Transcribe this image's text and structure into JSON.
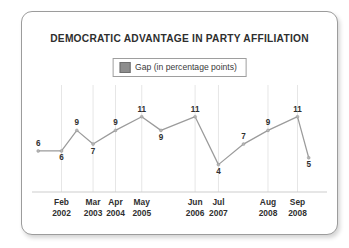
{
  "card": {
    "border_color": "#9c9c9c",
    "background": "#ffffff"
  },
  "title": "DEMOCRATIC ADVANTAGE IN PARTY AFFILIATION",
  "legend": {
    "swatch_color": "#8d8d8d",
    "label": "Gap (in percentage points)"
  },
  "chart_data": {
    "type": "line",
    "title": "DEMOCRATIC ADVANTAGE IN PARTY AFFILIATION",
    "xlabel": "",
    "ylabel": "",
    "ylim": [
      0,
      13
    ],
    "grid": "vertical",
    "legend_position": "top-center",
    "line_color": "#9b9b9b",
    "marker_color": "#b4b4b4",
    "series": [
      {
        "name": "Gap (in percentage points)",
        "values": [
          6,
          6,
          9,
          7,
          9,
          11,
          9,
          11,
          4,
          7,
          9,
          11,
          5
        ]
      }
    ],
    "point_labels": [
      "6",
      "6",
      "9",
      "7",
      "9",
      "11",
      "9",
      "11",
      "4",
      "7",
      "9",
      "11",
      "5"
    ],
    "label_side": [
      "above",
      "below",
      "above",
      "below",
      "above",
      "above",
      "below",
      "above",
      "below",
      "above",
      "above",
      "above",
      "below"
    ],
    "x_positions": [
      0.021,
      0.1,
      0.152,
      0.207,
      0.283,
      0.372,
      0.437,
      0.553,
      0.632,
      0.717,
      0.8,
      0.9,
      0.938
    ],
    "axis_labels": [
      {
        "month": "Feb",
        "year": "2002",
        "pos": 0.1
      },
      {
        "month": "Mar",
        "year": "2003",
        "pos": 0.207
      },
      {
        "month": "Apr",
        "year": "2004",
        "pos": 0.283
      },
      {
        "month": "May",
        "year": "2005",
        "pos": 0.372
      },
      {
        "month": "Jun",
        "year": "2006",
        "pos": 0.553
      },
      {
        "month": "Jul",
        "year": "2007",
        "pos": 0.632
      },
      {
        "month": "Aug",
        "year": "2008",
        "pos": 0.8
      },
      {
        "month": "Sep",
        "year": "2008",
        "pos": 0.9
      }
    ],
    "gridline_positions": [
      0.1,
      0.207,
      0.283,
      0.372,
      0.553,
      0.632,
      0.8,
      0.9
    ]
  }
}
